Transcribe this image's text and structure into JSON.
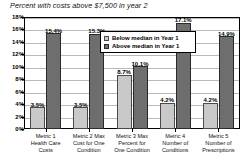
{
  "chart_data": {
    "type": "bar",
    "title": "Percent with costs above $7,500 in year 2",
    "xlabel": "",
    "ylabel": "",
    "ylim": [
      0,
      18
    ],
    "ytick_labels": [
      "18%",
      "16%",
      "14%",
      "12%",
      "10%",
      "8%",
      "6%",
      "4%",
      "2%",
      "0%"
    ],
    "ytick_values": [
      18,
      16,
      14,
      12,
      10,
      8,
      6,
      4,
      2,
      0
    ],
    "grid": true,
    "legend_position": "upper-right-inside",
    "categories": [
      "Metric 1 Health Care Costs",
      "Metric 2 Max Cost for One Condition",
      "Metric 3 Max Percent for One Condition",
      "Metric 4 Number of Conditions",
      "Metric 5 Number of Prescriptions"
    ],
    "category_lines": [
      [
        "Metric 1",
        "Health Care",
        "Costs"
      ],
      [
        "Metric 2 Max",
        "Cost for One",
        "Condition"
      ],
      [
        "Metric 3 Max",
        "Percent for",
        "One Condition"
      ],
      [
        "Metric 4",
        "Number of",
        "Conditions"
      ],
      [
        "Metric 5",
        "Number of",
        "Prescriptions"
      ]
    ],
    "series": [
      {
        "name": "Below median in Year 1",
        "color": "#c9c9c9",
        "values": [
          3.5,
          3.5,
          8.7,
          4.2,
          4.2
        ],
        "labels": [
          "3.5%",
          "3.5%",
          "8.7%",
          "4.2%",
          "4.2%"
        ]
      },
      {
        "name": "Above median in Year 1",
        "color": "#6e6e6e",
        "values": [
          15.4,
          15.3,
          10.1,
          17.1,
          14.9
        ],
        "labels": [
          "15.4%",
          "15.3%",
          "10.1%",
          "17.1%",
          "14.9%"
        ]
      }
    ]
  }
}
